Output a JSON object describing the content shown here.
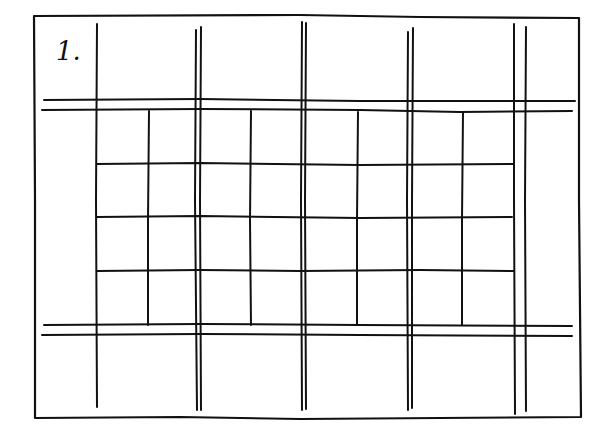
{
  "figure": {
    "label": "1.",
    "colors": {
      "stroke": "#111111",
      "background": "#ffffff"
    },
    "frame": {
      "x1": 33,
      "y1": 15,
      "x2": 580,
      "y2": 418
    },
    "horizontal_bands": [
      {
        "name": "top-band",
        "y": [
          100,
          110
        ],
        "x_start": 42,
        "x_end": 575
      },
      {
        "name": "bottom-band",
        "y": [
          325,
          335
        ],
        "x_start": 42,
        "x_end": 572
      }
    ],
    "tall_verticals": [
      {
        "name": "col-1",
        "x": [
          96
        ],
        "y_start": 24,
        "y_end": 407
      },
      {
        "name": "col-2",
        "x": [
          196,
          200
        ],
        "y_start": 28,
        "y_end": 410
      },
      {
        "name": "col-3",
        "x": [
          302,
          306
        ],
        "y_start": 22,
        "y_end": 410
      },
      {
        "name": "col-4",
        "x": [
          408,
          412
        ],
        "y_start": 30,
        "y_end": 410
      },
      {
        "name": "col-5",
        "x": [
          514,
          526
        ],
        "y_start": 24,
        "y_end": 412
      }
    ],
    "inner_grid": {
      "x_start": 96,
      "x_end": 514,
      "row_lines_y": [
        163,
        217,
        270
      ],
      "short_verticals_x": [
        148,
        250,
        358,
        462
      ],
      "y_start": 110,
      "y_end": 325,
      "columns": 8,
      "rows": 4
    }
  }
}
